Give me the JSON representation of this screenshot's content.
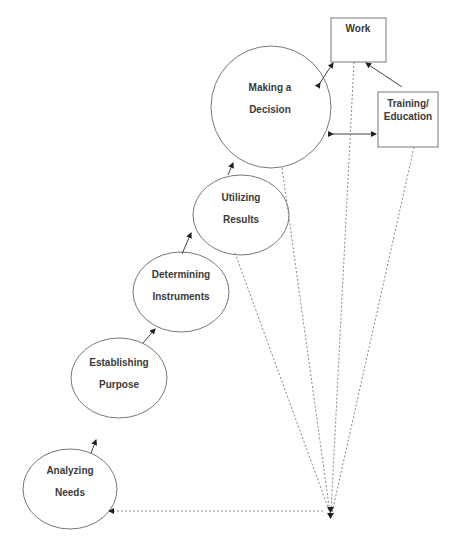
{
  "diagram": {
    "type": "process-flow",
    "nodes": [
      {
        "id": "analyzing",
        "shape": "ellipse",
        "line1": "Analyzing",
        "line2": "Needs"
      },
      {
        "id": "establishing",
        "shape": "ellipse",
        "line1": "Establishing",
        "line2": "Purpose"
      },
      {
        "id": "determining",
        "shape": "ellipse",
        "line1": "Determining",
        "line2": "Instruments"
      },
      {
        "id": "utilizing",
        "shape": "ellipse",
        "line1": "Utilizing",
        "line2": "Results"
      },
      {
        "id": "decision",
        "shape": "ellipse",
        "line1": "Making a",
        "line2": "Decision"
      },
      {
        "id": "work",
        "shape": "rect",
        "line1": "Work"
      },
      {
        "id": "training",
        "shape": "rect",
        "line1": "Training/",
        "line2": "Education"
      }
    ],
    "edges": [
      {
        "from": "analyzing",
        "to": "establishing",
        "style": "solid"
      },
      {
        "from": "establishing",
        "to": "determining",
        "style": "solid"
      },
      {
        "from": "determining",
        "to": "utilizing",
        "style": "solid"
      },
      {
        "from": "utilizing",
        "to": "decision",
        "style": "solid"
      },
      {
        "from": "decision",
        "to": "work",
        "style": "solid",
        "bidirectional": true
      },
      {
        "from": "training",
        "to": "work",
        "style": "solid"
      },
      {
        "from": "training",
        "to": "decision",
        "style": "solid",
        "bidirectional": true
      },
      {
        "from": "utilizing",
        "to": "convergence",
        "style": "dashed"
      },
      {
        "from": "decision",
        "to": "convergence",
        "style": "dashed"
      },
      {
        "from": "work",
        "to": "convergence",
        "style": "dashed"
      },
      {
        "from": "training",
        "to": "convergence",
        "style": "dashed"
      },
      {
        "from": "convergence",
        "to": "analyzing",
        "style": "dashed"
      }
    ]
  }
}
